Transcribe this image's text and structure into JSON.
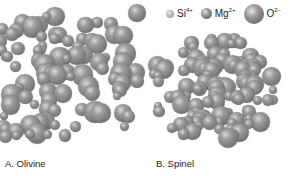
{
  "legend": {
    "items": [
      {
        "ion": "Si",
        "charge": "4+",
        "size": "small"
      },
      {
        "ion": "Mg",
        "charge": "2+",
        "size": "medium"
      },
      {
        "ion": "O",
        "charge": "2−",
        "size": "large"
      }
    ]
  },
  "panels": [
    {
      "id": "olivine",
      "caption": "A. Olivine",
      "structure": "loose ordered packing of spheres"
    },
    {
      "id": "spinel",
      "caption": "B. Spinel",
      "structure": "dense close-packed cluster of spheres"
    }
  ],
  "colors": {
    "sphere": "#8a8a8a",
    "highlight": "#dcdcdc",
    "background": "#ffffff"
  }
}
